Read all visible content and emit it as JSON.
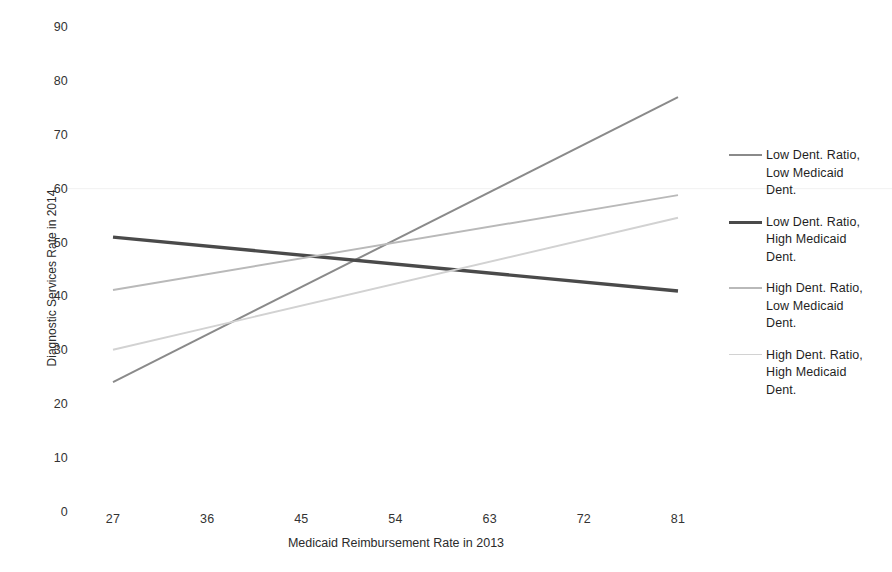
{
  "chart_data": {
    "type": "line",
    "title": "",
    "subtitle": "",
    "xlabel": "Medicaid Reimbursement Rate in 2013",
    "ylabel": "Diagnostic Services Rate in 2014",
    "xlim": [
      22.5,
      85.5
    ],
    "ylim": [
      0,
      90
    ],
    "xticks": [
      27,
      36,
      45,
      54,
      63,
      72,
      81
    ],
    "yticks": [
      0,
      10,
      20,
      30,
      40,
      50,
      60,
      70,
      80,
      90
    ],
    "grid": false,
    "faint_gridline_at": 60,
    "legend_position": "right",
    "series": [
      {
        "name": "Low Dent. Ratio, Low Medicaid Dent.",
        "color": "#8a8a8a",
        "width": 2.0,
        "x": [
          27,
          81
        ],
        "values": [
          24.1,
          77.0
        ]
      },
      {
        "name": "Low Dent. Ratio, High Medicaid Dent.",
        "color": "#4a4a4a",
        "width": 3.4,
        "x": [
          27,
          81
        ],
        "values": [
          51.0,
          41.0
        ]
      },
      {
        "name": "High Dent. Ratio, Low Medicaid Dent.",
        "color": "#b9b9b9",
        "width": 1.9,
        "x": [
          27,
          81
        ],
        "values": [
          41.2,
          58.8
        ]
      },
      {
        "name": "High Dent. Ratio, High Medicaid Dent.",
        "color": "#d2d2d2",
        "width": 1.9,
        "x": [
          27,
          81
        ],
        "values": [
          30.1,
          54.6
        ]
      }
    ]
  },
  "axes": {
    "y_title": "Diagnostic Services Rate in 2014",
    "x_title": "Medicaid Reimbursement Rate in 2013",
    "y_tick_labels": [
      "90",
      "80",
      "70",
      "60",
      "50",
      "40",
      "30",
      "20",
      "10",
      "0"
    ],
    "x_tick_labels": [
      "27",
      "36",
      "45",
      "54",
      "63",
      "72",
      "81"
    ]
  },
  "legend": {
    "entries": [
      {
        "label": "Low Dent. Ratio,\nLow Medicaid\nDent.",
        "color": "#8a8a8a",
        "width": 2.0
      },
      {
        "label": "Low Dent. Ratio,\nHigh Medicaid\nDent.",
        "color": "#4a4a4a",
        "width": 3.4
      },
      {
        "label": "High Dent. Ratio,\nLow Medicaid\nDent.",
        "color": "#b9b9b9",
        "width": 1.9
      },
      {
        "label": "High Dent. Ratio,\nHigh Medicaid\nDent.",
        "color": "#d2d2d2",
        "width": 1.9
      }
    ]
  }
}
